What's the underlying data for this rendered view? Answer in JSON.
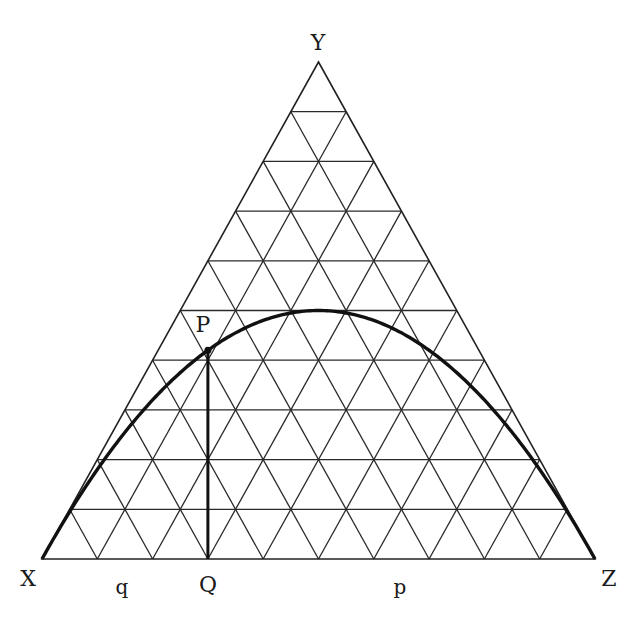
{
  "diagram": {
    "type": "ternary-de-finetti",
    "vertices": {
      "left": "X",
      "top": "Y",
      "right": "Z"
    },
    "point_label": "P",
    "foot_label": "Q",
    "segment_labels": {
      "left": "q",
      "right": "p"
    },
    "grid_divisions": 10,
    "q_value": 0.3,
    "colors": {
      "lines": "#2a2a2a",
      "curve": "#111111",
      "background": "#ffffff"
    }
  }
}
